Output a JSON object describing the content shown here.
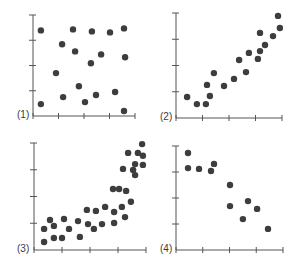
{
  "chart_data": [
    {
      "type": "scatter",
      "label": "(1)",
      "title": "",
      "xlabel": "",
      "ylabel": "",
      "xlim": [
        0,
        4
      ],
      "ylim": [
        0,
        4
      ],
      "grid": false,
      "x_ticks": 5,
      "y_ticks": 5,
      "points": [
        [
          0.31,
          3.39
        ],
        [
          1.57,
          3.43
        ],
        [
          2.31,
          3.35
        ],
        [
          3.02,
          3.31
        ],
        [
          3.57,
          3.47
        ],
        [
          1.14,
          2.84
        ],
        [
          1.65,
          2.56
        ],
        [
          2.67,
          2.44
        ],
        [
          3.61,
          2.33
        ],
        [
          2.27,
          2.09
        ],
        [
          0.9,
          1.7
        ],
        [
          1.8,
          1.18
        ],
        [
          1.18,
          0.75
        ],
        [
          2.47,
          0.83
        ],
        [
          3.22,
          0.95
        ],
        [
          0.31,
          0.47
        ],
        [
          2.04,
          0.55
        ],
        [
          3.57,
          0.2
        ]
      ]
    },
    {
      "type": "scatter",
      "label": "(2)",
      "title": "",
      "xlabel": "",
      "ylabel": "",
      "xlim": [
        0,
        4
      ],
      "ylim": [
        0,
        4
      ],
      "grid": false,
      "x_ticks": 5,
      "y_ticks": 5,
      "points": [
        [
          0.42,
          0.8
        ],
        [
          0.79,
          0.53
        ],
        [
          1.13,
          0.53
        ],
        [
          1.28,
          0.84
        ],
        [
          1.17,
          1.26
        ],
        [
          1.43,
          1.71
        ],
        [
          1.81,
          1.22
        ],
        [
          2.19,
          1.49
        ],
        [
          2.64,
          1.75
        ],
        [
          2.38,
          2.21
        ],
        [
          2.75,
          2.48
        ],
        [
          3.09,
          2.25
        ],
        [
          3.17,
          2.55
        ],
        [
          3.36,
          2.78
        ],
        [
          3.17,
          3.24
        ],
        [
          3.66,
          3.12
        ],
        [
          3.92,
          3.43
        ],
        [
          3.85,
          3.89
        ]
      ]
    },
    {
      "type": "scatter",
      "label": "(3)",
      "title": "",
      "xlabel": "",
      "ylabel": "",
      "xlim": [
        0,
        4
      ],
      "ylim": [
        0,
        4
      ],
      "grid": false,
      "x_ticks": 5,
      "y_ticks": 5,
      "points": [
        [
          0.36,
          0.79
        ],
        [
          0.36,
          0.3
        ],
        [
          0.57,
          1.12
        ],
        [
          0.71,
          0.9
        ],
        [
          0.71,
          0.45
        ],
        [
          1.0,
          0.45
        ],
        [
          1.07,
          1.16
        ],
        [
          1.25,
          0.79
        ],
        [
          1.57,
          1.08
        ],
        [
          1.64,
          0.49
        ],
        [
          1.89,
          1.5
        ],
        [
          1.93,
          0.97
        ],
        [
          2.21,
          1.46
        ],
        [
          2.14,
          0.79
        ],
        [
          2.43,
          0.97
        ],
        [
          2.54,
          1.61
        ],
        [
          2.86,
          1.42
        ],
        [
          2.86,
          1.01
        ],
        [
          2.82,
          2.28
        ],
        [
          3.04,
          2.28
        ],
        [
          3.14,
          1.61
        ],
        [
          3.25,
          1.23
        ],
        [
          3.29,
          2.21
        ],
        [
          3.46,
          1.8
        ],
        [
          3.18,
          3.03
        ],
        [
          3.36,
          3.63
        ],
        [
          3.54,
          2.99
        ],
        [
          3.61,
          3.21
        ],
        [
          3.61,
          2.8
        ],
        [
          3.71,
          3.63
        ],
        [
          3.86,
          3.96
        ],
        [
          3.89,
          3.52
        ],
        [
          3.89,
          3.18
        ]
      ]
    },
    {
      "type": "scatter",
      "label": "(4)",
      "title": "",
      "xlabel": "",
      "ylabel": "",
      "xlim": [
        0,
        4
      ],
      "ylim": [
        0,
        4
      ],
      "grid": false,
      "x_ticks": 5,
      "y_ticks": 5,
      "points": [
        [
          0.45,
          3.73
        ],
        [
          0.45,
          3.15
        ],
        [
          0.86,
          3.12
        ],
        [
          1.31,
          3.04
        ],
        [
          1.42,
          3.31
        ],
        [
          2.02,
          2.5
        ],
        [
          2.02,
          1.69
        ],
        [
          2.69,
          1.88
        ],
        [
          3.03,
          1.58
        ],
        [
          2.5,
          1.19
        ],
        [
          3.44,
          0.81
        ]
      ]
    }
  ],
  "panels": [
    {
      "label": "(1)",
      "ox": 33,
      "oy": 116,
      "xEnd": 135,
      "yTop": 15
    },
    {
      "label": "(2)",
      "ox": 176,
      "oy": 118,
      "xEnd": 282,
      "yTop": 13
    },
    {
      "label": "(3)",
      "ox": 34,
      "oy": 250,
      "xEnd": 146,
      "yTop": 143
    },
    {
      "label": "(4)",
      "ox": 176,
      "oy": 250,
      "xEnd": 283,
      "yTop": 146
    }
  ],
  "colors": {
    "axis": "#555555",
    "point": "#3d3d3d",
    "label": "#3a3a3a"
  }
}
